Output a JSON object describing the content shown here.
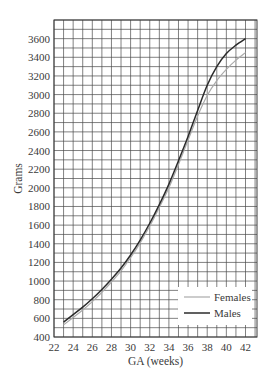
{
  "chart_data": {
    "type": "line",
    "title": "",
    "xlabel": "GA (weeks)",
    "ylabel": "Grams",
    "xlim": [
      22,
      43.2
    ],
    "ylim": [
      400,
      3800
    ],
    "grid": true,
    "x_ticks": [
      22,
      24,
      26,
      28,
      30,
      32,
      34,
      36,
      38,
      40,
      42
    ],
    "y_ticks": [
      400,
      600,
      800,
      1000,
      1200,
      1400,
      1600,
      1800,
      2000,
      2200,
      2400,
      2600,
      2800,
      3000,
      3200,
      3400,
      3600
    ],
    "legend_position": "lower right",
    "x": [
      23,
      24,
      25,
      26,
      27,
      28,
      29,
      30,
      31,
      32,
      33,
      34,
      35,
      36,
      37,
      38,
      39,
      40,
      41,
      42
    ],
    "series": [
      {
        "name": "Females",
        "color": "#aaaaaa",
        "values": [
          530,
          610,
          690,
          780,
          880,
          990,
          1110,
          1250,
          1410,
          1590,
          1790,
          2000,
          2250,
          2510,
          2770,
          2990,
          3150,
          3270,
          3370,
          3450
        ]
      },
      {
        "name": "Males",
        "color": "#2b2b2b",
        "values": [
          560,
          640,
          720,
          810,
          910,
          1020,
          1140,
          1280,
          1440,
          1620,
          1820,
          2040,
          2290,
          2550,
          2830,
          3100,
          3300,
          3440,
          3530,
          3600
        ]
      }
    ]
  },
  "legend": {
    "females_label": "Females",
    "males_label": "Males"
  },
  "axes": {
    "x_label": "GA (weeks)",
    "y_label": "Grams"
  }
}
